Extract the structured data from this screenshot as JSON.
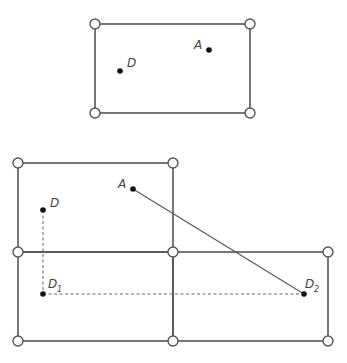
{
  "diagram": {
    "top_figure": {
      "description": "Single rectangle with hinged corners",
      "points": [
        {
          "label": "A"
        },
        {
          "label": "D"
        }
      ]
    },
    "bottom_figure": {
      "description": "Three-panel unfolded layout with segment A to D2 and dashed reflections",
      "points": [
        {
          "label": "A"
        },
        {
          "label": "D"
        },
        {
          "label": "D",
          "subscript": "1"
        },
        {
          "label": "D",
          "subscript": "2"
        }
      ]
    }
  }
}
